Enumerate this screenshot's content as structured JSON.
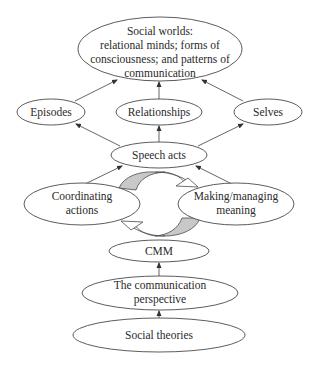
{
  "diagram": {
    "colors": {
      "stroke": "#4a4a4a",
      "text": "#2a2a2a",
      "cycle_fill": "#c8c8c8",
      "background": "#ffffff"
    },
    "nodes": {
      "social_worlds": {
        "lines": [
          "Social worlds:",
          "relational minds;  forms of",
          "consciousness; and patterns of",
          "communication"
        ]
      },
      "episodes": {
        "lines": [
          "Episodes"
        ]
      },
      "relationships": {
        "lines": [
          "Relationships"
        ]
      },
      "selves": {
        "lines": [
          "Selves"
        ]
      },
      "speech_acts": {
        "lines": [
          "Speech acts"
        ]
      },
      "coordinating_actions": {
        "lines": [
          "Coordinating",
          "actions"
        ]
      },
      "making_managing_meaning": {
        "lines": [
          "Making/managing",
          "meaning"
        ]
      },
      "cmm": {
        "lines": [
          "CMM"
        ]
      },
      "communication_perspective": {
        "lines": [
          "The communication",
          "perspective"
        ]
      },
      "social_theories": {
        "lines": [
          "Social theories"
        ]
      }
    },
    "edges": [
      {
        "from": "episodes",
        "to": "social_worlds"
      },
      {
        "from": "relationships",
        "to": "social_worlds"
      },
      {
        "from": "selves",
        "to": "social_worlds"
      },
      {
        "from": "speech_acts",
        "to": "episodes"
      },
      {
        "from": "speech_acts",
        "to": "relationships"
      },
      {
        "from": "speech_acts",
        "to": "selves"
      },
      {
        "from": "coordinating_actions",
        "to": "speech_acts"
      },
      {
        "from": "making_managing_meaning",
        "to": "speech_acts"
      },
      {
        "from": "communication_perspective",
        "to": "cmm"
      },
      {
        "from": "social_theories",
        "to": "communication_perspective"
      }
    ],
    "cycle": {
      "between": [
        "coordinating_actions",
        "making_managing_meaning"
      ],
      "direction": "clockwise"
    }
  }
}
